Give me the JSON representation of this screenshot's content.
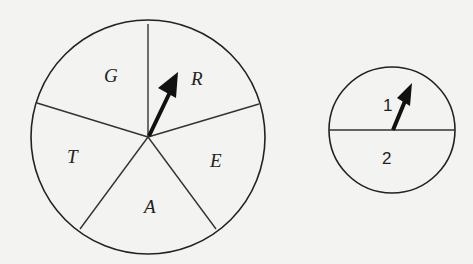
{
  "figure": {
    "background_color": "#f3f3f1",
    "line_color": "#222222",
    "spinner_large": {
      "sections": 5,
      "labels": {
        "top_left": "G",
        "top_right": "R",
        "right": "E",
        "bottom": "A",
        "left": "T"
      },
      "pointer_target": "R"
    },
    "spinner_small": {
      "sections": 2,
      "labels": {
        "top": "1",
        "bottom": "2"
      },
      "pointer_target": "1"
    }
  }
}
